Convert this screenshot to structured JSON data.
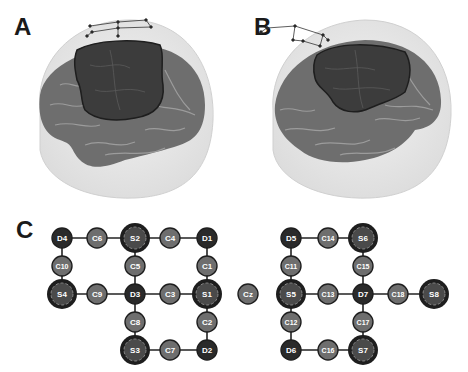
{
  "figure": {
    "panels": [
      {
        "id": "A",
        "label": "A",
        "description": "3D head rendering, lateral left view, with highlighted cortical region and electrode grid"
      },
      {
        "id": "B",
        "label": "B",
        "description": "3D head rendering, lateral left-frontal view, with highlighted cortical region and electrode grid"
      },
      {
        "id": "C",
        "label": "C",
        "description": "Electrode network montage diagram"
      }
    ]
  },
  "diagram": {
    "colors": {
      "S": "#4a4a4a",
      "S_ring": "#1e1e1e",
      "D": "#2a2a2a",
      "C": "#6e6e6e",
      "edge": "#222222",
      "head": "#e8e8e8",
      "brain": "#6a6a6a",
      "highlight": "#3a3a3a"
    },
    "nodes": [
      {
        "id": "D4",
        "label": "D4",
        "type": "D",
        "x": 62,
        "y": 238
      },
      {
        "id": "C6",
        "label": "C6",
        "type": "C",
        "x": 97,
        "y": 238
      },
      {
        "id": "S2",
        "label": "S2",
        "type": "S",
        "x": 135,
        "y": 238
      },
      {
        "id": "C4",
        "label": "C4",
        "type": "C",
        "x": 170,
        "y": 238
      },
      {
        "id": "D1",
        "label": "D1",
        "type": "D",
        "x": 207,
        "y": 238
      },
      {
        "id": "C10",
        "label": "C10",
        "type": "C",
        "x": 62,
        "y": 266
      },
      {
        "id": "C5",
        "label": "C5",
        "type": "C",
        "x": 135,
        "y": 266
      },
      {
        "id": "C1",
        "label": "C1",
        "type": "C",
        "x": 207,
        "y": 266
      },
      {
        "id": "S4",
        "label": "S4",
        "type": "S",
        "x": 62,
        "y": 294
      },
      {
        "id": "C9",
        "label": "C9",
        "type": "C",
        "x": 97,
        "y": 294
      },
      {
        "id": "D3",
        "label": "D3",
        "type": "D",
        "x": 135,
        "y": 294
      },
      {
        "id": "C3",
        "label": "C3",
        "type": "C",
        "x": 170,
        "y": 294
      },
      {
        "id": "S1",
        "label": "S1",
        "type": "S",
        "x": 207,
        "y": 294
      },
      {
        "id": "C8",
        "label": "C8",
        "type": "C",
        "x": 135,
        "y": 322
      },
      {
        "id": "C2",
        "label": "C2",
        "type": "C",
        "x": 207,
        "y": 322
      },
      {
        "id": "S3",
        "label": "S3",
        "type": "S",
        "x": 135,
        "y": 350
      },
      {
        "id": "C7",
        "label": "C7",
        "type": "C",
        "x": 170,
        "y": 350
      },
      {
        "id": "D2",
        "label": "D2",
        "type": "D",
        "x": 207,
        "y": 350
      },
      {
        "id": "Cz",
        "label": "Cz",
        "type": "C",
        "x": 248,
        "y": 294
      },
      {
        "id": "D5",
        "label": "D5",
        "type": "D",
        "x": 291,
        "y": 238
      },
      {
        "id": "C14",
        "label": "C14",
        "type": "C",
        "x": 328,
        "y": 238
      },
      {
        "id": "S6",
        "label": "S6",
        "type": "S",
        "x": 363,
        "y": 238
      },
      {
        "id": "C11",
        "label": "C11",
        "type": "C",
        "x": 291,
        "y": 266
      },
      {
        "id": "C15",
        "label": "C15",
        "type": "C",
        "x": 363,
        "y": 266
      },
      {
        "id": "S5",
        "label": "S5",
        "type": "S",
        "x": 291,
        "y": 294
      },
      {
        "id": "C13",
        "label": "C13",
        "type": "C",
        "x": 328,
        "y": 294
      },
      {
        "id": "D7",
        "label": "D7",
        "type": "D",
        "x": 363,
        "y": 294
      },
      {
        "id": "C18",
        "label": "C18",
        "type": "C",
        "x": 398,
        "y": 294
      },
      {
        "id": "S8",
        "label": "S8",
        "type": "S",
        "x": 434,
        "y": 294
      },
      {
        "id": "C12",
        "label": "C12",
        "type": "C",
        "x": 291,
        "y": 322
      },
      {
        "id": "C17",
        "label": "C17",
        "type": "C",
        "x": 363,
        "y": 322
      },
      {
        "id": "D6",
        "label": "D6",
        "type": "D",
        "x": 291,
        "y": 350
      },
      {
        "id": "C16",
        "label": "C16",
        "type": "C",
        "x": 328,
        "y": 350
      },
      {
        "id": "S7",
        "label": "S7",
        "type": "S",
        "x": 363,
        "y": 350
      }
    ],
    "edges": [
      [
        "D4",
        "S2"
      ],
      [
        "S2",
        "D1"
      ],
      [
        "D4",
        "S4"
      ],
      [
        "S2",
        "S3"
      ],
      [
        "D1",
        "D2"
      ],
      [
        "S4",
        "S1"
      ],
      [
        "S3",
        "D2"
      ],
      [
        "D5",
        "S6"
      ],
      [
        "D5",
        "D6"
      ],
      [
        "S6",
        "S7"
      ],
      [
        "S5",
        "S8"
      ],
      [
        "D6",
        "S7"
      ]
    ]
  }
}
